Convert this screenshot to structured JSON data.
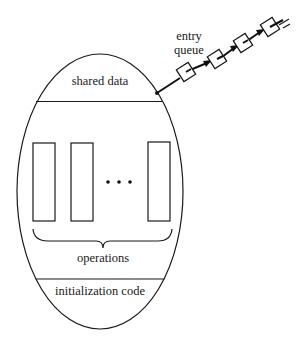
{
  "diagram": {
    "labels": {
      "shared_data": "shared data",
      "operations": "operations",
      "initialization_code": "initialization code",
      "entry_queue_line1": "entry",
      "entry_queue_line2": "queue",
      "ellipsis": "• • •"
    },
    "operation_count_shown": 3,
    "entry_queue_length": 4,
    "colors": {
      "stroke": "#1a1a1a",
      "background": "#ffffff"
    }
  }
}
